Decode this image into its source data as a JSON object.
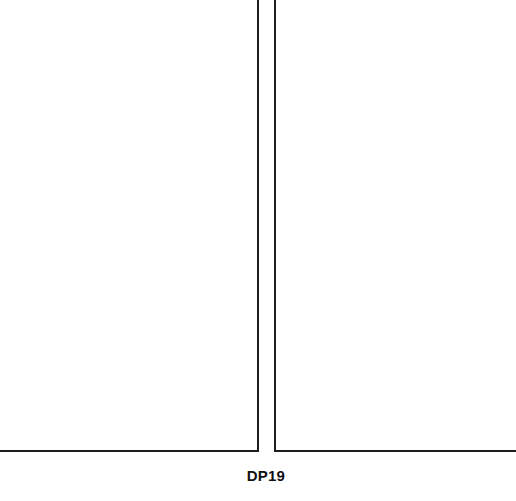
{
  "figure": {
    "caption": "DP19",
    "panels": [
      {
        "id": "left",
        "content": ""
      },
      {
        "id": "right",
        "content": ""
      }
    ],
    "line_color": "#1e1e1e",
    "background_color": "#ffffff"
  }
}
